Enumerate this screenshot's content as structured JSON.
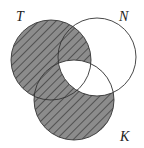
{
  "diagram": {
    "type": "venn",
    "sets": [
      {
        "label": "T",
        "cx": 51,
        "cy": 60,
        "r": 40
      },
      {
        "label": "N",
        "cx": 97,
        "cy": 57,
        "r": 39
      },
      {
        "label": "K",
        "cx": 74,
        "cy": 100,
        "r": 40
      }
    ],
    "shaded_region": "(T ∪ K) − (N ∩ K)",
    "shade_color": "#8c8c8c",
    "hatch_color": "#2a2a2a",
    "stroke_color": "#333333"
  },
  "labels": {
    "t": "T",
    "n": "N",
    "k": "K"
  }
}
